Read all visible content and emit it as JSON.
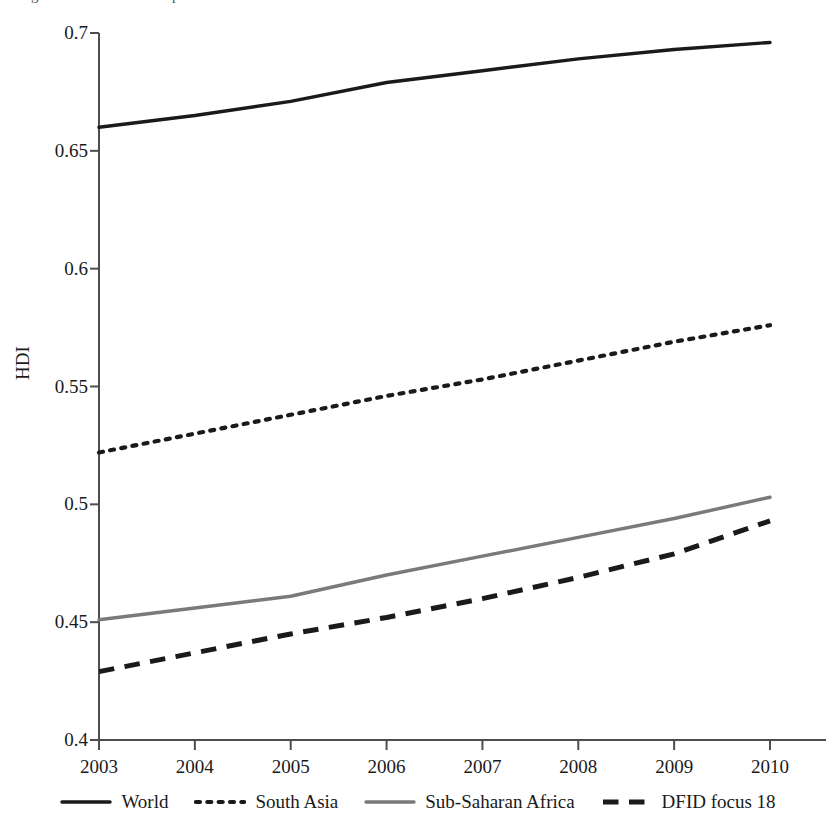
{
  "figure": {
    "top_caption_fragment": "Figure 3: Human Development Index",
    "axis_color": "#4d4d4d",
    "background": "#ffffff"
  },
  "axis": {
    "y_label": "HDI",
    "y_ticks": [
      "0.4",
      "0.45",
      "0.5",
      "0.55",
      "0.6",
      "0.65",
      "0.7"
    ],
    "x_ticks": [
      "2003",
      "2004",
      "2005",
      "2006",
      "2007",
      "2008",
      "2009",
      "2010"
    ]
  },
  "legend": {
    "position": "bottom",
    "items": [
      {
        "label": "World",
        "style": "solid",
        "color": "#1a1a1a"
      },
      {
        "label": "South Asia",
        "style": "dotted",
        "color": "#1a1a1a"
      },
      {
        "label": "Sub-Saharan Africa",
        "style": "solid",
        "color": "#7a7a7a"
      },
      {
        "label": "DFID focus 18",
        "style": "dashed",
        "color": "#1a1a1a"
      }
    ]
  },
  "chart_data": {
    "type": "line",
    "title": "Human Development Index",
    "xlabel": "",
    "ylabel": "HDI",
    "x": [
      2003,
      2004,
      2005,
      2006,
      2007,
      2008,
      2009,
      2010
    ],
    "xlim": [
      2003,
      2010
    ],
    "ylim": [
      0.4,
      0.7
    ],
    "y_ticks": [
      0.4,
      0.45,
      0.5,
      0.55,
      0.6,
      0.65,
      0.7
    ],
    "x_ticks": [
      2003,
      2004,
      2005,
      2006,
      2007,
      2008,
      2009,
      2010
    ],
    "grid": false,
    "legend_position": "bottom",
    "series": [
      {
        "name": "World",
        "style": "solid",
        "color": "#1a1a1a",
        "values": [
          0.66,
          0.665,
          0.671,
          0.679,
          0.684,
          0.689,
          0.693,
          0.696
        ]
      },
      {
        "name": "South Asia",
        "style": "dotted",
        "color": "#1a1a1a",
        "values": [
          0.522,
          0.53,
          0.538,
          0.546,
          0.553,
          0.561,
          0.569,
          0.576
        ]
      },
      {
        "name": "Sub-Saharan Africa",
        "style": "solid",
        "color": "#7a7a7a",
        "values": [
          0.451,
          0.456,
          0.461,
          0.47,
          0.478,
          0.486,
          0.494,
          0.503
        ]
      },
      {
        "name": "DFID focus 18",
        "style": "dashed",
        "color": "#1a1a1a",
        "values": [
          0.429,
          0.437,
          0.445,
          0.452,
          0.46,
          0.469,
          0.479,
          0.493
        ]
      }
    ]
  }
}
